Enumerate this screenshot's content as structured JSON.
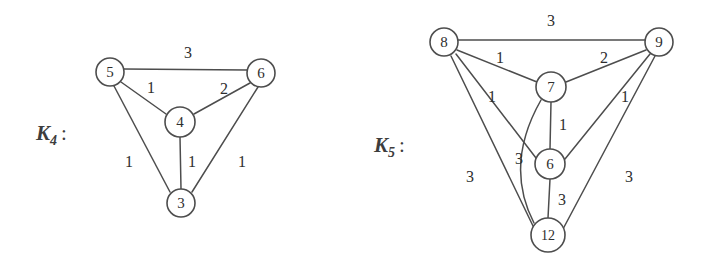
{
  "figure": {
    "background_color": "#ffffff",
    "stroke_color": "#4d4d4d",
    "text_color": "#2e2e2e"
  },
  "graphs": [
    {
      "id": "k4",
      "label_base": "K",
      "label_sub": "4",
      "label_colon": ":",
      "label_x": 36,
      "label_y": 140,
      "nodes": [
        {
          "id": "n5",
          "text": "5",
          "cx": 110,
          "cy": 72,
          "r": 14
        },
        {
          "id": "n6",
          "text": "6",
          "cx": 261,
          "cy": 73,
          "r": 14
        },
        {
          "id": "n4",
          "text": "4",
          "cx": 180,
          "cy": 122,
          "r": 15
        },
        {
          "id": "n3",
          "text": "3",
          "cx": 181,
          "cy": 203,
          "r": 14
        }
      ],
      "edges": [
        {
          "id": "e-5-6",
          "from": "5",
          "to": "6",
          "weight": "3",
          "x1": 124,
          "y1": 69,
          "x2": 247,
          "y2": 70,
          "lx": 188,
          "ly": 52
        },
        {
          "id": "e-5-4",
          "from": "5",
          "to": "4",
          "weight": "1",
          "x1": 121,
          "y1": 82,
          "x2": 166,
          "y2": 114,
          "lx": 151,
          "ly": 87
        },
        {
          "id": "e-4-6",
          "from": "4",
          "to": "6",
          "weight": "2",
          "x1": 194,
          "y1": 114,
          "x2": 250,
          "y2": 83,
          "lx": 224,
          "ly": 88
        },
        {
          "id": "e-5-3",
          "from": "5",
          "to": "3",
          "weight": "1",
          "x1": 114,
          "y1": 86,
          "x2": 170,
          "y2": 192,
          "lx": 129,
          "ly": 161
        },
        {
          "id": "e-4-3",
          "from": "4",
          "to": "3",
          "weight": "1",
          "x1": 180,
          "y1": 137,
          "x2": 181,
          "y2": 189,
          "lx": 192,
          "ly": 161
        },
        {
          "id": "e-6-3",
          "from": "6",
          "to": "3",
          "weight": "1",
          "x1": 258,
          "y1": 87,
          "x2": 192,
          "y2": 192,
          "lx": 242,
          "ly": 161
        }
      ],
      "curved_edges": []
    },
    {
      "id": "k5",
      "label_base": "K",
      "label_sub": "5",
      "label_colon": ":",
      "label_x": 374,
      "label_y": 152,
      "nodes": [
        {
          "id": "n8",
          "text": "8",
          "cx": 444,
          "cy": 42,
          "r": 14
        },
        {
          "id": "n9",
          "text": "9",
          "cx": 659,
          "cy": 42,
          "r": 14
        },
        {
          "id": "n7",
          "text": "7",
          "cx": 551,
          "cy": 87,
          "r": 15
        },
        {
          "id": "n6",
          "text": "6",
          "cx": 550,
          "cy": 164,
          "r": 15
        },
        {
          "id": "n12",
          "text": "12",
          "cx": 548,
          "cy": 235,
          "r": 17
        }
      ],
      "edges": [
        {
          "id": "e-8-9",
          "from": "8",
          "to": "9",
          "weight": "3",
          "x1": 458,
          "y1": 40,
          "x2": 645,
          "y2": 40,
          "lx": 551,
          "ly": 20
        },
        {
          "id": "e-8-7",
          "from": "8",
          "to": "7",
          "weight": "1",
          "x1": 457,
          "y1": 50,
          "x2": 537,
          "y2": 82,
          "lx": 500,
          "ly": 57
        },
        {
          "id": "e-7-9",
          "from": "7",
          "to": "9",
          "weight": "2",
          "x1": 566,
          "y1": 82,
          "x2": 646,
          "y2": 50,
          "lx": 604,
          "ly": 57
        },
        {
          "id": "e-8-6",
          "from": "8",
          "to": "6",
          "weight": "1",
          "x1": 456,
          "y1": 54,
          "x2": 536,
          "y2": 158,
          "lx": 492,
          "ly": 96
        },
        {
          "id": "e-6-9",
          "from": "6",
          "to": "9",
          "weight": "1",
          "x1": 565,
          "y1": 159,
          "x2": 650,
          "y2": 54,
          "lx": 625,
          "ly": 96
        },
        {
          "id": "e-7-6",
          "from": "7",
          "to": "6",
          "weight": "1",
          "x1": 551,
          "y1": 102,
          "x2": 550,
          "y2": 149,
          "lx": 563,
          "ly": 124
        },
        {
          "id": "e-6-12",
          "from": "6",
          "to": "12",
          "weight": "3",
          "x1": 550,
          "y1": 179,
          "x2": 548,
          "y2": 218,
          "lx": 562,
          "ly": 199
        },
        {
          "id": "e-8-12",
          "from": "8",
          "to": "12",
          "weight": "3",
          "x1": 451,
          "y1": 56,
          "x2": 534,
          "y2": 228,
          "lx": 470,
          "ly": 176
        },
        {
          "id": "e-9-12",
          "from": "9",
          "to": "12",
          "weight": "3",
          "x1": 655,
          "y1": 56,
          "x2": 563,
          "y2": 229,
          "lx": 629,
          "ly": 176
        }
      ],
      "curved_edges": [
        {
          "id": "e-7-12-curve",
          "from": "7",
          "to": "12",
          "weight": "3",
          "path": "M 541 100 Q 504 165 534 223",
          "lx": 519,
          "ly": 158
        }
      ]
    }
  ]
}
